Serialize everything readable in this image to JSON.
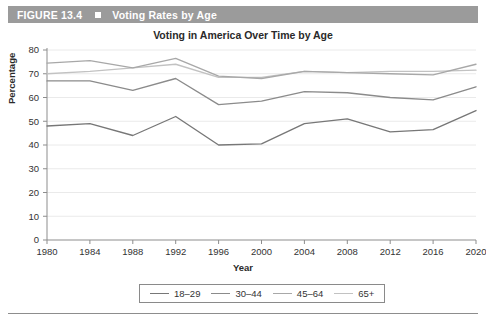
{
  "header": {
    "figure_number": "FIGURE 13.4",
    "bullet_icon": "square-bullet-icon",
    "title": "Voting Rates by Age",
    "bar_color": "#9b9b9b",
    "text_color": "#ffffff"
  },
  "axis": {
    "y_title": "Percentage",
    "x_title": "Year",
    "y_ticks": [
      "0",
      "10",
      "20",
      "30",
      "40",
      "50",
      "60",
      "70",
      "80"
    ],
    "x_ticks": [
      "1980",
      "1984",
      "1988",
      "1992",
      "1996",
      "2000",
      "2004",
      "2008",
      "2012",
      "2016",
      "2020"
    ]
  },
  "legend": {
    "items": [
      {
        "label": "18–29",
        "color": "#777777"
      },
      {
        "label": "30–44",
        "color": "#8b8b8b"
      },
      {
        "label": "45–64",
        "color": "#a8a8a8"
      },
      {
        "label": "65+",
        "color": "#c2c2c2"
      }
    ]
  },
  "chart_data": {
    "type": "line",
    "title": "Voting in America Over Time by Age",
    "xlabel": "Year",
    "ylabel": "Percentage",
    "ylim": [
      0,
      80
    ],
    "ytick_step": 10,
    "grid": true,
    "legend_position": "bottom",
    "categories": [
      "1980",
      "1984",
      "1988",
      "1992",
      "1996",
      "2000",
      "2004",
      "2008",
      "2012",
      "2016",
      "2020"
    ],
    "series": [
      {
        "name": "18–29",
        "color": "#777777",
        "values": [
          48,
          49,
          44,
          52,
          40,
          40.5,
          49,
          51,
          45.5,
          46.5,
          54.5
        ]
      },
      {
        "name": "30–44",
        "color": "#8b8b8b",
        "values": [
          67,
          67,
          63,
          68,
          57,
          58.5,
          62.5,
          62,
          60,
          59,
          64.5
        ]
      },
      {
        "name": "45–64",
        "color": "#a8a8a8",
        "values": [
          74.5,
          75.5,
          72.5,
          76.5,
          69,
          68,
          71,
          70.5,
          70,
          69.5,
          74
        ]
      },
      {
        "name": "65+",
        "color": "#c2c2c2",
        "values": [
          70,
          71,
          72.5,
          74,
          68.5,
          68.5,
          71,
          70.5,
          71,
          71,
          71.5
        ]
      }
    ]
  }
}
